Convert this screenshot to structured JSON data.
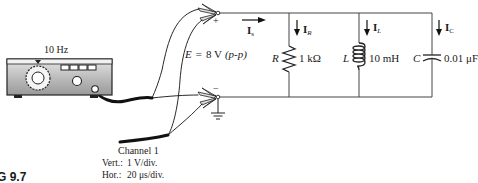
{
  "generator": {
    "frequency_label": "10 Hz"
  },
  "source": {
    "label_E": "E",
    "equals": "=",
    "value": "8 V",
    "qualifier": "(p-p)",
    "plus": "+",
    "minus": "−"
  },
  "currents": {
    "source": {
      "symbol": "I",
      "sub": "s"
    },
    "resistor": {
      "symbol": "I",
      "sub": "R"
    },
    "inductor": {
      "symbol": "I",
      "sub": "L"
    },
    "capacitor": {
      "symbol": "I",
      "sub": "C"
    }
  },
  "components": {
    "resistor": {
      "symbol": "R",
      "value": "1 kΩ"
    },
    "inductor": {
      "symbol": "L",
      "value": "10 mH"
    },
    "capacitor": {
      "symbol": "C",
      "value": "0.01 μF"
    }
  },
  "oscilloscope": {
    "channel": "Channel 1",
    "vert_label": "Vert.:",
    "vert_value": "1 V/div.",
    "hor_label": "Hor.:",
    "hor_value": "20 μs/div."
  },
  "figure": {
    "label": "G 9.7"
  }
}
